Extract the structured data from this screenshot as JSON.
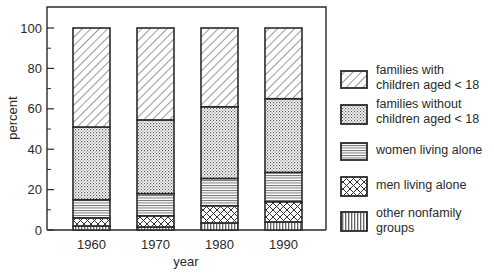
{
  "chart_data": {
    "type": "bar",
    "stacked": true,
    "title": "",
    "xlabel": "year",
    "ylabel": "percent",
    "ylim": [
      0,
      100
    ],
    "yticks": [
      0,
      20,
      40,
      60,
      80,
      100
    ],
    "yminor_ticks": [
      10,
      30,
      50,
      70,
      90
    ],
    "grid": false,
    "legend_position": "right",
    "categories": [
      "1960",
      "1970",
      "1980",
      "1990"
    ],
    "series": [
      {
        "name": "other nonfamily groups",
        "pattern": "vertical-lines",
        "values": [
          2,
          1.5,
          3.5,
          4
        ]
      },
      {
        "name": "men living alone",
        "pattern": "crosshatch",
        "values": [
          4,
          5.5,
          8.5,
          10
        ]
      },
      {
        "name": "women living alone",
        "pattern": "horizontal-lines",
        "values": [
          9,
          11,
          13.5,
          14.5
        ]
      },
      {
        "name": "families without children aged < 18",
        "pattern": "dots",
        "values": [
          36,
          36.5,
          35.5,
          36.5
        ]
      },
      {
        "name": "families with children aged < 18",
        "pattern": "diagonal-lines",
        "values": [
          49,
          45.5,
          39,
          35
        ]
      }
    ]
  },
  "legend": [
    {
      "label": "families with\nchildren aged < 18",
      "pattern": "diag"
    },
    {
      "label": "families without\nchildren aged < 18",
      "pattern": "dots"
    },
    {
      "label": "women living alone",
      "pattern": "hlines"
    },
    {
      "label": "men living alone",
      "pattern": "cross"
    },
    {
      "label": "other nonfamily\ngroups",
      "pattern": "vlines"
    }
  ],
  "colors": {
    "ink": "#2a2a2a",
    "background": "#ffffff"
  }
}
